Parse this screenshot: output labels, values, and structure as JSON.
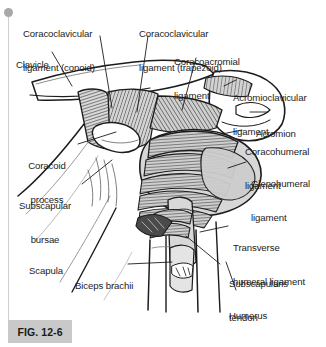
{
  "figure": {
    "caption": "FIG. 12-6",
    "background_color": "#ffffff",
    "ink_color": "#1c1c1c",
    "fill_light": "#d6d6d6",
    "fill_mid": "#b8b8b8",
    "caption_box_color": "#c9c9c9"
  },
  "scrollbar": {
    "rail_color": "#cfcfcf",
    "pin_name": "scroll-pin"
  },
  "labels": [
    {
      "id": "coracoclavicular-conoid",
      "line1": "Coracoclavicular",
      "line2": "ligament (conoid)",
      "align": "left"
    },
    {
      "id": "coracoclavicular-trapezoid",
      "line1": "Coracoclavicular",
      "line2": "ligament (trapezoid)",
      "align": "left"
    },
    {
      "id": "clavicle",
      "line1": "Clavicle",
      "line2": "",
      "align": "left"
    },
    {
      "id": "coracoacromial",
      "line1": "Coracoacromial",
      "line2": "ligament",
      "align": "left"
    },
    {
      "id": "acromioclavicular",
      "line1": "Acromioclavicular",
      "line2": "ligament",
      "align": "left"
    },
    {
      "id": "acromion",
      "line1": "Acromion",
      "line2": "",
      "align": "left"
    },
    {
      "id": "coracohumeral",
      "line1": "Coracohumeral",
      "line2": "ligament",
      "align": "left"
    },
    {
      "id": "glenohumeral",
      "line1": "Glenohumeral",
      "line2": "ligament",
      "align": "left"
    },
    {
      "id": "coracoid-process",
      "line1": "Coracoid",
      "line2": "process",
      "align": "right"
    },
    {
      "id": "subscapular-bursae",
      "line1": "Subscapular",
      "line2": "bursae",
      "align": "right"
    },
    {
      "id": "transverse-humeral",
      "line1": "Transverse",
      "line2": "humeral ligament",
      "align": "left"
    },
    {
      "id": "scapula",
      "line1": "Scapula",
      "line2": "",
      "align": "left"
    },
    {
      "id": "biceps-brachii",
      "line1": "Biceps brachii",
      "line2": "",
      "align": "left"
    },
    {
      "id": "subscapularis-tendon",
      "line1": "Subscapularis",
      "line2": "tendon",
      "align": "left"
    },
    {
      "id": "humerus",
      "line1": "Humerus",
      "line2": "",
      "align": "left"
    }
  ]
}
